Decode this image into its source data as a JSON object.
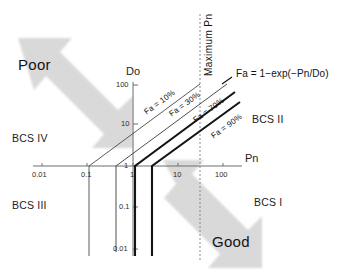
{
  "figure": {
    "type": "log-log absorption classification diagram",
    "equation_label": "Fa = 1−exp(−Pn/Do)",
    "max_pn_label": "Maximum Pn"
  },
  "axes": {
    "x": {
      "name": "Pn",
      "ticks": [
        "0.01",
        "0.1",
        "1",
        "10",
        "100"
      ],
      "scale": "log"
    },
    "y": {
      "name": "Do",
      "ticks_upper": [
        "100",
        "10",
        "1"
      ],
      "ticks_lower": [
        "1",
        "0.1",
        "0.01"
      ],
      "scale": "log"
    }
  },
  "fa_lines": [
    {
      "label": "Fa = 10%",
      "value": 10
    },
    {
      "label": "Fa = 30%",
      "value": 30
    },
    {
      "label": "Fa = 70%",
      "value": 70
    },
    {
      "label": "Fa = 90%",
      "value": 90
    }
  ],
  "quadrants": [
    {
      "name": "BCS IV",
      "label": "BCS IV"
    },
    {
      "name": "BCS III",
      "label": "BCS III"
    },
    {
      "name": "BCS II",
      "label": "BCS II"
    },
    {
      "name": "BCS I",
      "label": "BCS I"
    }
  ],
  "arrows": [
    {
      "name": "poor-arrow",
      "label": "Poor",
      "direction": "up-left"
    },
    {
      "name": "good-arrow",
      "label": "Good",
      "direction": "down-right"
    }
  ],
  "colors": {
    "background": "#ffffff",
    "arrow_fill": "#d9d9d9",
    "axis_line": "#6f6f6f",
    "thin_curve": "#3a3a3a",
    "thick_curve": "#141414",
    "dotted_line": "#8a8a8a",
    "text": "#1a1a1a"
  }
}
